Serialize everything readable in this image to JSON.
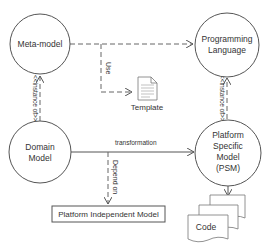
{
  "nodes": {
    "meta_model": {
      "label": "Meta-model"
    },
    "programming_language": {
      "line1": "Programming",
      "line2": "Language"
    },
    "domain_model": {
      "line1": "Domain",
      "line2": "Model"
    },
    "psm": {
      "line1": "Platform",
      "line2": "Specific",
      "line3": "Model",
      "line4": "(PSM)"
    },
    "pim": {
      "label": "Platform Independent Model"
    },
    "template": {
      "label": "Template"
    },
    "code": {
      "label": "Code"
    }
  },
  "edges": {
    "use": {
      "label": "Use"
    },
    "instance_of_left": {
      "label": "<<instance of>>"
    },
    "instance_of_right": {
      "label": "<<instance of>>"
    },
    "transformation": {
      "label": "transformation"
    },
    "depend_on": {
      "label": "Depend on"
    }
  },
  "colors": {
    "stroke": "#555555",
    "text": "#333333",
    "background": "#ffffff"
  }
}
